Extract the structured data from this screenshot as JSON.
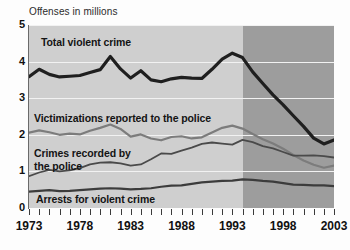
{
  "chart_data": {
    "type": "line",
    "title": "Offenses in millions",
    "xlabel": "",
    "ylabel": "Offenses in millions",
    "xlim": [
      1973,
      2003
    ],
    "ylim": [
      0,
      5
    ],
    "yticks": [
      "0",
      "1",
      "2",
      "3",
      "4",
      "5"
    ],
    "xticks": [
      "1973",
      "1978",
      "1983",
      "1988",
      "1993",
      "1998",
      "2003"
    ],
    "grid": true,
    "legend_position": "in-plot annotations",
    "shaded_region": {
      "label": "redesign period",
      "from": 1994,
      "to": 2003,
      "color": "#9d9d9d"
    },
    "plot_background": "#cfcfcf",
    "x": [
      1973,
      1974,
      1975,
      1976,
      1977,
      1978,
      1979,
      1980,
      1981,
      1982,
      1983,
      1984,
      1985,
      1986,
      1987,
      1988,
      1989,
      1990,
      1991,
      1992,
      1993,
      1994,
      1995,
      1996,
      1997,
      1998,
      1999,
      2000,
      2001,
      2002,
      2003
    ],
    "series": [
      {
        "name": "Total violent crime",
        "color": "#1f1f1f",
        "width": 3.2,
        "values": [
          3.59,
          3.79,
          3.65,
          3.58,
          3.6,
          3.62,
          3.7,
          3.78,
          4.14,
          3.8,
          3.55,
          3.75,
          3.5,
          3.45,
          3.53,
          3.57,
          3.55,
          3.54,
          3.79,
          4.07,
          4.23,
          4.11,
          3.72,
          3.4,
          3.09,
          2.82,
          2.52,
          2.23,
          1.91,
          1.75,
          1.86
        ]
      },
      {
        "name": "Victimizations reported to the police",
        "color": "#7c7c7c",
        "width": 2.2,
        "values": [
          2.06,
          2.12,
          2.07,
          2.0,
          2.03,
          2.01,
          2.11,
          2.19,
          2.28,
          2.16,
          1.95,
          2.01,
          1.9,
          1.85,
          1.94,
          1.96,
          1.9,
          1.93,
          2.06,
          2.19,
          2.25,
          2.17,
          2.02,
          1.88,
          1.76,
          1.62,
          1.45,
          1.3,
          1.18,
          1.1,
          1.16
        ]
      },
      {
        "name": "Crimes recorded by the police",
        "color": "#4a4a4a",
        "width": 1.8,
        "values": [
          0.87,
          0.97,
          1.04,
          1.0,
          1.03,
          1.09,
          1.19,
          1.24,
          1.25,
          1.22,
          1.16,
          1.19,
          1.33,
          1.49,
          1.48,
          1.57,
          1.65,
          1.75,
          1.79,
          1.76,
          1.73,
          1.86,
          1.8,
          1.69,
          1.63,
          1.53,
          1.43,
          1.43,
          1.44,
          1.42,
          1.38
        ]
      },
      {
        "name": "Arrests for violent crime",
        "color": "#3c3c3c",
        "width": 2.2,
        "values": [
          0.45,
          0.47,
          0.49,
          0.46,
          0.47,
          0.49,
          0.51,
          0.53,
          0.54,
          0.53,
          0.51,
          0.52,
          0.54,
          0.58,
          0.61,
          0.62,
          0.66,
          0.7,
          0.72,
          0.74,
          0.75,
          0.78,
          0.77,
          0.74,
          0.72,
          0.68,
          0.64,
          0.63,
          0.62,
          0.62,
          0.6
        ]
      }
    ],
    "annotations": [
      {
        "id": "total",
        "text": "Total violent crime"
      },
      {
        "id": "victim",
        "text": "Victimizations reported to the police"
      },
      {
        "id": "crimes",
        "text": "Crimes recorded by\nthe police"
      },
      {
        "id": "arrests",
        "text": "Arrests for violent crime"
      }
    ]
  }
}
